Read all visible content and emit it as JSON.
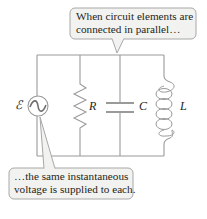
{
  "diagram": {
    "type": "parallel-RLC-circuit",
    "callouts": {
      "top": {
        "line1": "When circuit elements are",
        "line2": "connected in parallel…"
      },
      "bottom": {
        "line1": "…the same instantaneous",
        "line2": "voltage is supplied to each."
      }
    },
    "labels": {
      "source": "ℰ",
      "resistor": "R",
      "capacitor": "C",
      "inductor": "L"
    },
    "colors": {
      "wire": "#9a9a9a",
      "callout_fill": "#f2f2f0",
      "callout_border": "#a8a8a8",
      "text": "#231f20"
    }
  }
}
